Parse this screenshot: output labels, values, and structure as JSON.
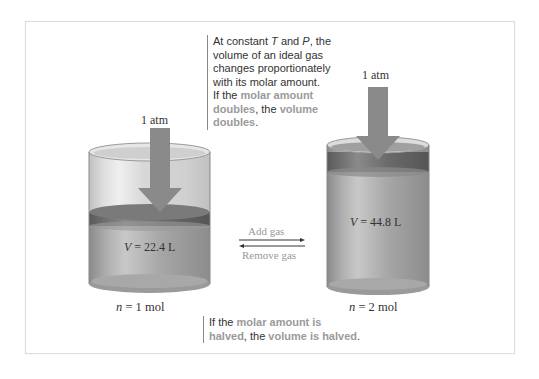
{
  "notes": {
    "top": {
      "line1_a": "At constant ",
      "line1_T": "T",
      "line1_b": " and ",
      "line1_P": "P",
      "line1_c": ", the",
      "line2": "volume of an ideal gas",
      "line3": "changes proportionately",
      "line4": "with its molar amount.",
      "line5_a": "If the ",
      "line5_hl": "molar amount",
      "line6_hl": "doubles",
      "line6_b": ", the ",
      "line6_hl2": "volume",
      "line7_hl": "doubles",
      "line7_b": "."
    },
    "bottom": {
      "line1_a": "If the ",
      "line1_hl": "molar amount is",
      "line2_hl": "halved",
      "line2_b": ", the ",
      "line2_hl2": "volume is halved",
      "line2_c": "."
    }
  },
  "left_cylinder": {
    "pressure_label": "1 atm",
    "volume_var": "V",
    "volume_value": " = 22.4 L",
    "moles_var": "n",
    "moles_value": " = 1 mol"
  },
  "right_cylinder": {
    "pressure_label": "1 atm",
    "volume_var": "V",
    "volume_value": " = 44.8 L",
    "moles_var": "n",
    "moles_value": " = 2 mol"
  },
  "process": {
    "forward_label": "Add gas",
    "reverse_label": "Remove gas"
  },
  "colors": {
    "highlight_text": "#9a9a9a",
    "cylinder_body": "#a8a8a8",
    "piston": "#6e6e6e",
    "arrow": "#8a8a8a"
  }
}
